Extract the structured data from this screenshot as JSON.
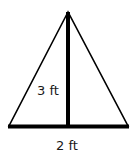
{
  "diagram": {
    "shape": "isosceles-triangle",
    "height_label": "3 ft",
    "base_label": "2 ft",
    "colors": {
      "stroke": "#000000",
      "text": "#1a1a1a",
      "background": "#ffffff"
    }
  }
}
